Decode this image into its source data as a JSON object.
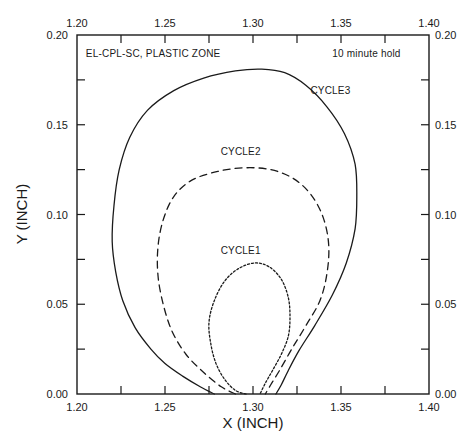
{
  "chart_data": {
    "type": "line",
    "title": "EL-CPL-SC, PLASTIC ZONE",
    "subtitle": "10 minute hold",
    "xlabel": "X (INCH)",
    "ylabel": "Y (INCH)",
    "xlim": [
      1.2,
      1.4
    ],
    "ylim": [
      0.0,
      0.2
    ],
    "grid": false,
    "legend": "none (curves labeled inline)",
    "x_ticks": [
      "1.20",
      "1.25",
      "1.30",
      "1.35",
      "1.40"
    ],
    "y_ticks": [
      "0.00",
      "0.05",
      "0.10",
      "0.15",
      "0.20"
    ],
    "x_minor_step": 0.025,
    "y_minor_step": 0.025,
    "annotations": [
      {
        "text": "EL-CPL-SC, PLASTIC ZONE",
        "x": 1.205,
        "y": 0.188
      },
      {
        "text": "10 minute hold",
        "x": 1.345,
        "y": 0.188
      },
      {
        "text": "CYCLE3",
        "x": 1.344,
        "y": 0.167
      },
      {
        "text": "CYCLE2",
        "x": 1.293,
        "y": 0.133
      },
      {
        "text": "CYCLE1",
        "x": 1.293,
        "y": 0.078
      }
    ],
    "series": [
      {
        "name": "CYCLE3",
        "style": "solid",
        "points": [
          [
            1.278,
            0.0
          ],
          [
            1.27,
            0.004
          ],
          [
            1.26,
            0.01
          ],
          [
            1.25,
            0.017
          ],
          [
            1.242,
            0.025
          ],
          [
            1.233,
            0.037
          ],
          [
            1.226,
            0.052
          ],
          [
            1.222,
            0.068
          ],
          [
            1.22,
            0.085
          ],
          [
            1.221,
            0.105
          ],
          [
            1.224,
            0.125
          ],
          [
            1.23,
            0.143
          ],
          [
            1.24,
            0.158
          ],
          [
            1.255,
            0.169
          ],
          [
            1.272,
            0.176
          ],
          [
            1.29,
            0.18
          ],
          [
            1.305,
            0.181
          ],
          [
            1.318,
            0.179
          ],
          [
            1.33,
            0.172
          ],
          [
            1.342,
            0.16
          ],
          [
            1.352,
            0.145
          ],
          [
            1.358,
            0.128
          ],
          [
            1.359,
            0.11
          ],
          [
            1.358,
            0.092
          ],
          [
            1.353,
            0.073
          ],
          [
            1.345,
            0.055
          ],
          [
            1.335,
            0.038
          ],
          [
            1.326,
            0.024
          ],
          [
            1.32,
            0.013
          ],
          [
            1.316,
            0.005
          ],
          [
            1.313,
            0.0
          ]
        ]
      },
      {
        "name": "CYCLE2",
        "style": "dashed",
        "points": [
          [
            1.29,
            0.0
          ],
          [
            1.282,
            0.004
          ],
          [
            1.272,
            0.012
          ],
          [
            1.262,
            0.022
          ],
          [
            1.254,
            0.035
          ],
          [
            1.249,
            0.05
          ],
          [
            1.246,
            0.066
          ],
          [
            1.246,
            0.082
          ],
          [
            1.249,
            0.097
          ],
          [
            1.255,
            0.11
          ],
          [
            1.265,
            0.119
          ],
          [
            1.28,
            0.124
          ],
          [
            1.295,
            0.126
          ],
          [
            1.31,
            0.125
          ],
          [
            1.323,
            0.12
          ],
          [
            1.333,
            0.111
          ],
          [
            1.34,
            0.098
          ],
          [
            1.343,
            0.083
          ],
          [
            1.342,
            0.067
          ],
          [
            1.338,
            0.052
          ],
          [
            1.33,
            0.038
          ],
          [
            1.322,
            0.025
          ],
          [
            1.315,
            0.013
          ],
          [
            1.31,
            0.005
          ],
          [
            1.307,
            0.0
          ]
        ]
      },
      {
        "name": "CYCLE1",
        "style": "dotted",
        "points": [
          [
            1.296,
            0.0
          ],
          [
            1.29,
            0.002
          ],
          [
            1.284,
            0.008
          ],
          [
            1.279,
            0.017
          ],
          [
            1.276,
            0.028
          ],
          [
            1.275,
            0.04
          ],
          [
            1.278,
            0.052
          ],
          [
            1.284,
            0.063
          ],
          [
            1.292,
            0.07
          ],
          [
            1.301,
            0.073
          ],
          [
            1.309,
            0.071
          ],
          [
            1.316,
            0.064
          ],
          [
            1.32,
            0.054
          ],
          [
            1.321,
            0.043
          ],
          [
            1.32,
            0.032
          ],
          [
            1.316,
            0.022
          ],
          [
            1.311,
            0.013
          ],
          [
            1.307,
            0.006
          ],
          [
            1.304,
            0.0
          ]
        ]
      }
    ]
  }
}
